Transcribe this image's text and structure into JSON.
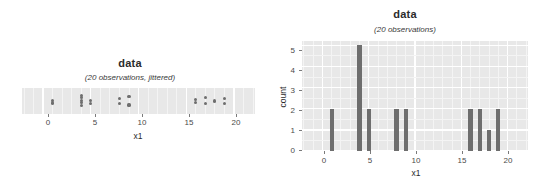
{
  "chart_data": [
    {
      "type": "scatter",
      "id": "strip-plot",
      "title": "data",
      "subtitle": "(20 observations, jittered)",
      "xlabel": "x1",
      "ylabel": "",
      "xlim": [
        -2.2,
        22.2
      ],
      "ylim": [
        -1,
        1
      ],
      "xticks": [
        0,
        5,
        10,
        15,
        20
      ],
      "xticklabels": [
        "0",
        "5",
        "10",
        "15",
        "20"
      ],
      "grid": true,
      "legend": "none",
      "note": "one-dimensional jittered strip plot of x1; vertical position is random jitter only",
      "points": [
        {
          "x": 1,
          "jitter": 0.1
        },
        {
          "x": 1,
          "jitter": -0.25
        },
        {
          "x": 4,
          "jitter": 0.45
        },
        {
          "x": 4,
          "jitter": 0.1
        },
        {
          "x": 4,
          "jitter": -0.2
        },
        {
          "x": 4,
          "jitter": -0.55
        },
        {
          "x": 4,
          "jitter": 0.7
        },
        {
          "x": 5,
          "jitter": 0.05
        },
        {
          "x": 5,
          "jitter": -0.3
        },
        {
          "x": 8,
          "jitter": 0.35
        },
        {
          "x": 8,
          "jitter": -0.35
        },
        {
          "x": 9,
          "jitter": 0.55
        },
        {
          "x": 9,
          "jitter": -0.5
        },
        {
          "x": 16,
          "jitter": 0.15
        },
        {
          "x": 16,
          "jitter": -0.15
        },
        {
          "x": 17,
          "jitter": 0.45
        },
        {
          "x": 17,
          "jitter": -0.35
        },
        {
          "x": 18,
          "jitter": 0.0
        },
        {
          "x": 19,
          "jitter": 0.3
        },
        {
          "x": 19,
          "jitter": -0.3
        }
      ]
    },
    {
      "type": "bar",
      "id": "histogram",
      "title": "data",
      "subtitle": "(20 observations)",
      "xlabel": "x1",
      "ylabel": "count",
      "xlim": [
        -2.2,
        22.2
      ],
      "ylim": [
        0,
        5.2
      ],
      "xticks": [
        0,
        5,
        10,
        15,
        20
      ],
      "xticklabels": [
        "0",
        "5",
        "10",
        "15",
        "20"
      ],
      "yticks": [
        0,
        1,
        2,
        3,
        4,
        5
      ],
      "yticklabels": [
        "0",
        "1",
        "2",
        "3",
        "4",
        "5"
      ],
      "grid": true,
      "legend": "none",
      "categories": [
        1,
        4,
        5,
        8,
        9,
        16,
        17,
        18,
        19
      ],
      "values": [
        2,
        5,
        2,
        2,
        2,
        2,
        2,
        1,
        2
      ]
    }
  ],
  "left_chart": {
    "title": "data",
    "subtitle": "(20 observations, jittered)",
    "xlabel": "x1",
    "xticklabels": [
      "0",
      "5",
      "10",
      "15",
      "20"
    ]
  },
  "right_chart": {
    "title": "data",
    "subtitle": "(20 observations)",
    "xlabel": "x1",
    "ylabel": "count",
    "xticklabels": [
      "0",
      "5",
      "10",
      "15",
      "20"
    ],
    "yticklabels": [
      "0",
      "1",
      "2",
      "3",
      "4",
      "5"
    ]
  },
  "colors": {
    "panel_bg": "#e8e8e8",
    "grid_major": "#ffffff",
    "grid_minor": "#f4f4f4",
    "mark": "#6e6e6e",
    "text": "#2b2b2b"
  }
}
